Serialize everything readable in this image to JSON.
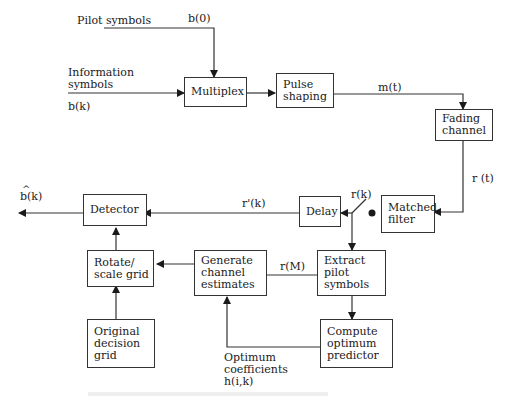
{
  "diagram": {
    "blocks": {
      "multiplex": [
        "Multiplex"
      ],
      "pulse_shaping": [
        "Pulse",
        "shaping"
      ],
      "fading_channel": [
        "Fading",
        "channel"
      ],
      "matched_filter": [
        "Matched",
        "filter"
      ],
      "delay": [
        "Delay"
      ],
      "detector": [
        "Detector"
      ],
      "rotate_scale": [
        "Rotate/",
        "scale grid"
      ],
      "generate_estimates": [
        "Generate",
        "channel",
        "estimates"
      ],
      "extract_pilot": [
        "Extract",
        "pilot",
        "symbols"
      ],
      "original_grid": [
        "Original",
        "decision",
        "grid"
      ],
      "compute_predictor": [
        "Compute",
        "optimum",
        "predictor"
      ]
    },
    "labels": {
      "pilot_symbols": "Pilot  symbols",
      "b0": "b(0)",
      "info_line1": "Information",
      "info_line2": "symbols",
      "bk": "b(k)",
      "mt": "m(t)",
      "rt": "r (t)",
      "rk": "r(k)",
      "rprime_k": "r'(k)",
      "rM": "r(M)",
      "bhat_k": "b(k)",
      "bhat_hat": "^",
      "opt_line1": "Optimum",
      "opt_line2": "coefficients",
      "opt_line3": "h(i,k)"
    }
  }
}
